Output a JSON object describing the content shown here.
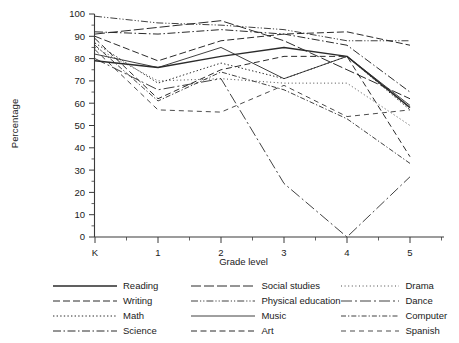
{
  "chart_data": {
    "type": "line",
    "title": "",
    "xlabel": "Grade level",
    "ylabel": "Percentage",
    "categories": [
      "K",
      "1",
      "2",
      "3",
      "4",
      "5"
    ],
    "ylim": [
      0,
      100
    ],
    "ytick_step": 10,
    "yticks": [
      "0",
      "10",
      "20",
      "30",
      "40",
      "50",
      "60",
      "70",
      "80",
      "90",
      "100"
    ],
    "grid": false,
    "legend_position": "below",
    "legend_columns": 3,
    "series": [
      {
        "name": "Reading",
        "dash": "solid",
        "values": [
          79,
          76,
          81,
          85,
          81,
          58
        ]
      },
      {
        "name": "Writing",
        "dash": "dashed",
        "values": [
          90,
          79,
          88,
          91,
          92,
          86
        ]
      },
      {
        "name": "Math",
        "dash": "dotted",
        "values": [
          87,
          69,
          78,
          71,
          81,
          57
        ]
      },
      {
        "name": "Science",
        "dash": "dash-dot",
        "values": [
          92,
          91,
          93,
          91,
          86,
          65
        ]
      },
      {
        "name": "Social studies",
        "dash": "long-dash",
        "values": [
          91,
          94,
          97,
          88,
          75,
          62
        ]
      },
      {
        "name": "Physical education",
        "dash": "dash-dot-dot",
        "values": [
          99,
          96,
          95,
          93,
          88,
          88
        ]
      },
      {
        "name": "Music",
        "dash": "solid-thin",
        "values": [
          82,
          76,
          85,
          71,
          81,
          59
        ]
      },
      {
        "name": "Art",
        "dash": "dashed-med",
        "values": [
          89,
          62,
          75,
          81,
          81,
          36
        ]
      },
      {
        "name": "Drama",
        "dash": "fine-dotted",
        "values": [
          85,
          70,
          71,
          69,
          69,
          50
        ]
      },
      {
        "name": "Dance",
        "dash": "dash-dot-lg",
        "values": [
          80,
          66,
          71,
          24,
          0,
          27
        ]
      },
      {
        "name": "Computer",
        "dash": "dash-dot-sm",
        "values": [
          86,
          61,
          74,
          66,
          53,
          33
        ]
      },
      {
        "name": "Spanish",
        "dash": "loose-dash",
        "values": [
          84,
          57,
          56,
          68,
          54,
          57
        ]
      }
    ]
  },
  "axis": {
    "y_title": "Percentage",
    "x_title": "Grade level"
  },
  "legend": {
    "columns": [
      {
        "items": [
          {
            "label": "Reading",
            "style": "solid"
          },
          {
            "label": "Writing",
            "style": "dashed"
          },
          {
            "label": "Math",
            "style": "dotted"
          },
          {
            "label": "Science",
            "style": "dash-dot"
          }
        ]
      },
      {
        "items": [
          {
            "label": "Social studies",
            "style": "long-dash"
          },
          {
            "label": "Physical education",
            "style": "dash-dot-dot"
          },
          {
            "label": "Music",
            "style": "solid-thin"
          },
          {
            "label": "Art",
            "style": "dashed-med"
          }
        ]
      },
      {
        "items": [
          {
            "label": "Drama",
            "style": "fine-dotted"
          },
          {
            "label": "Dance",
            "style": "dash-dot-lg"
          },
          {
            "label": "Computer",
            "style": "dash-dot-sm"
          },
          {
            "label": "Spanish",
            "style": "loose-dash"
          }
        ]
      }
    ]
  },
  "colors": {
    "line": "#2b2b2b",
    "axis": "#3a3a3a",
    "background": "#ffffff",
    "text": "#1a1a1a"
  }
}
